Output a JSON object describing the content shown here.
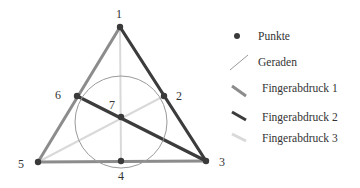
{
  "diagram": {
    "points": [
      {
        "id": "1",
        "x": 120,
        "y": 27,
        "lx": 116,
        "ly": 18
      },
      {
        "id": "2",
        "x": 164,
        "y": 96,
        "lx": 176,
        "ly": 100
      },
      {
        "id": "3",
        "x": 206,
        "y": 161,
        "lx": 219,
        "ly": 166
      },
      {
        "id": "4",
        "x": 121,
        "y": 161,
        "lx": 118,
        "ly": 180
      },
      {
        "id": "5",
        "x": 38,
        "y": 162,
        "lx": 18,
        "ly": 168
      },
      {
        "id": "6",
        "x": 77,
        "y": 96,
        "lx": 55,
        "ly": 99
      },
      {
        "id": "7",
        "x": 121,
        "y": 117,
        "lx": 109,
        "ly": 109
      }
    ],
    "circle": {
      "cx": 121,
      "cy": 122,
      "r": 46
    },
    "lines": [
      {
        "from": "5",
        "to": "1",
        "style": "fingerabdruck1"
      },
      {
        "from": "5",
        "to": "3",
        "style": "fingerabdruck1"
      },
      {
        "from": "1",
        "to": "3",
        "style": "fingerabdruck2"
      },
      {
        "from": "6",
        "to": "3",
        "style": "fingerabdruck2"
      },
      {
        "from": "1",
        "to": "4",
        "style": "fingerabdruck3"
      },
      {
        "from": "5",
        "to": "2",
        "style": "fingerabdruck3"
      }
    ],
    "colors": {
      "punkte": "#3a3a3a",
      "geraden": "#9a9a9a",
      "fingerabdruck1": "#8c8c8c",
      "fingerabdruck2": "#3c3c3c",
      "fingerabdruck3": "#d9d9d9"
    }
  },
  "legend": {
    "items": [
      {
        "label": "Punkte",
        "symbol": "dot"
      },
      {
        "label": "Geraden",
        "symbol": "thin-line"
      },
      {
        "label": "Fingerabdruck 1",
        "symbol": "medium-line"
      },
      {
        "label": "Fingerabdruck 2",
        "symbol": "dark-line"
      },
      {
        "label": "Fingerabdruck 3",
        "symbol": "light-line"
      }
    ]
  }
}
